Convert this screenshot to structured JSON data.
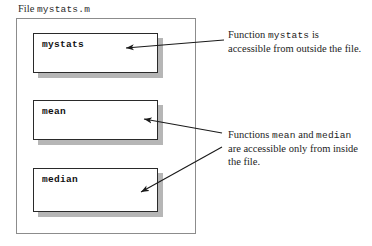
{
  "diagram": {
    "file_label": {
      "prefix": "File ",
      "filename": "mystats.m"
    },
    "function_boxes": [
      {
        "name": "mystats"
      },
      {
        "name": "mean"
      },
      {
        "name": "median"
      }
    ],
    "annotations": [
      {
        "id": "mystats-note",
        "line1_prefix": "Function ",
        "line1_code": "mystats",
        "line1_suffix": " is",
        "line2": "accessible from outside the file."
      },
      {
        "id": "local-functions-note",
        "line1_prefix": "Functions ",
        "line1_code_a": "mean",
        "line1_mid": " and ",
        "line1_code_b": "median",
        "line2": "are accessible only from inside",
        "line3": "the file."
      }
    ],
    "colors": {
      "box_border": "#2a2a2a",
      "box_shadow": "#b6b6b6",
      "file_border": "#8c8c8c",
      "arrow": "#1a1a1a",
      "text": "#1c1c1c"
    }
  }
}
